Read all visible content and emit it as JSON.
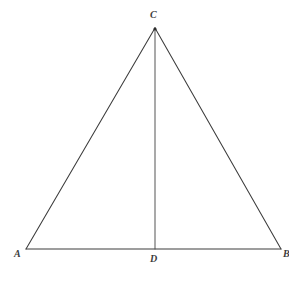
{
  "figure": {
    "type": "geometry-diagram",
    "background_color": "#ffffff",
    "stroke_color": "#3c3c3c",
    "label_color": "#3c3c3c",
    "stroke_width": 1,
    "points": {
      "A": {
        "label": "A",
        "x": 26,
        "y": 249
      },
      "B": {
        "label": "B",
        "x": 281,
        "y": 249
      },
      "C": {
        "label": "C",
        "x": 155,
        "y": 28
      },
      "D": {
        "label": "D",
        "x": 155,
        "y": 249
      }
    },
    "segments": [
      {
        "name": "side-ac",
        "from": "A",
        "to": "C"
      },
      {
        "name": "side-cb",
        "from": "C",
        "to": "B"
      },
      {
        "name": "base-ab",
        "from": "A",
        "to": "B"
      },
      {
        "name": "altitude-cd",
        "from": "C",
        "to": "D"
      }
    ],
    "labels": {
      "a": "A",
      "b": "B",
      "c": "C",
      "d": "D"
    }
  }
}
